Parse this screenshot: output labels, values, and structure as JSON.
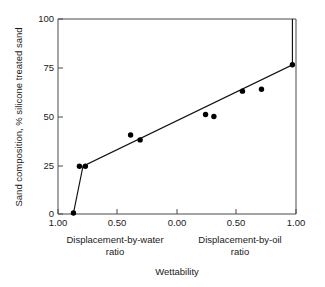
{
  "chart_data": {
    "type": "scatter",
    "title": "",
    "xlabel": "Wettability",
    "ylabel": "Sand composition, % silicone treated sand",
    "xlabel_left_line1": "Displacement-by-water",
    "xlabel_left_line2": "ratio",
    "xlabel_right_line1": "Displacement-by-oil",
    "xlabel_right_line2": "ratio",
    "xtick_labels": [
      "1.00",
      "0.50",
      "0.00",
      "0.50",
      "1.00"
    ],
    "xtick_values": [
      -1.0,
      -0.5,
      0.0,
      0.5,
      1.0
    ],
    "ytick_labels": [
      "0",
      "25",
      "50",
      "75",
      "100"
    ],
    "ytick_values": [
      0,
      25,
      50,
      75,
      100
    ],
    "xlim": [
      -1.0,
      1.0
    ],
    "ylim": [
      0,
      100
    ],
    "grid": false,
    "legend": false,
    "axis_note": "x axis is a mirrored ratio scale: left half is displacement-by-water ratio decreasing 1.00 to 0.00, right half is displacement-by-oil ratio increasing 0.00 to 1.00",
    "series": [
      {
        "name": "Sand composition vs wettability",
        "marker": "filled-circle",
        "marker_color": "#000000",
        "line_color": "#111111",
        "x": [
          -0.87,
          -0.82,
          -0.77,
          -0.39,
          -0.31,
          0.24,
          0.31,
          0.55,
          0.71,
          0.97
        ],
        "y": [
          0.5,
          24.5,
          24.5,
          40.5,
          38.0,
          51.0,
          50.0,
          63.0,
          64.0,
          76.5
        ]
      }
    ],
    "fit_line": {
      "name": "connecting trend line",
      "x": [
        -0.87,
        -0.79,
        0.97,
        0.97
      ],
      "y": [
        0.5,
        24.5,
        76.5,
        100.0
      ]
    }
  },
  "colors": {
    "background": "#ffffff",
    "axis": "#4a4a4a",
    "text": "#1a1a1a",
    "data": "#000000"
  }
}
